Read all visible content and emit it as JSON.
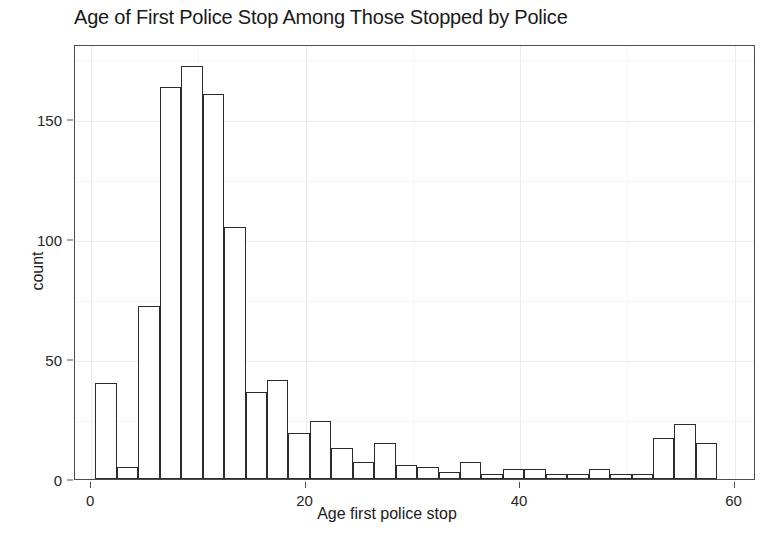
{
  "chart_data": {
    "type": "bar",
    "title": "Age of First Police Stop Among Those Stopped by Police",
    "xlabel": "Age first police stop",
    "ylabel": "count",
    "subtitle": "",
    "grid": true,
    "legend": "none",
    "binwidth": 2,
    "bin_start": 0.4,
    "xlim": [
      -1.5,
      62
    ],
    "ylim": [
      0,
      181
    ],
    "x_ticks": [
      0,
      20,
      40,
      60
    ],
    "x_tick_labels": [
      "0",
      "20",
      "40",
      "60"
    ],
    "x_minor_ticks": [
      10,
      30,
      50
    ],
    "y_ticks": [
      0,
      50,
      100,
      150
    ],
    "y_tick_labels": [
      "0",
      "50",
      "100",
      "150"
    ],
    "y_minor_ticks": [
      25,
      75,
      125,
      175
    ],
    "categories": [
      "0.4-2.4",
      "2.4-4.4",
      "4.4-6.4",
      "6.4-8.4",
      "8.4-10.4",
      "10.4-12.4",
      "12.4-14.4",
      "14.4-16.4",
      "16.4-18.4",
      "18.4-20.4",
      "20.4-22.4",
      "22.4-24.4",
      "24.4-26.4",
      "26.4-28.4",
      "28.4-30.4",
      "30.4-32.4",
      "32.4-34.4",
      "34.4-36.4",
      "36.4-38.4",
      "38.4-40.4",
      "40.4-42.4",
      "42.4-44.4",
      "44.4-46.4",
      "46.4-48.4",
      "48.4-50.4",
      "50.4-52.4",
      "52.4-54.4",
      "54.4-56.4",
      "56.4-58.4"
    ],
    "bin_centers": [
      1.4,
      3.4,
      5.4,
      7.4,
      9.4,
      11.4,
      13.4,
      15.4,
      17.4,
      19.4,
      21.4,
      23.4,
      25.4,
      27.4,
      29.4,
      31.4,
      33.4,
      35.4,
      37.4,
      39.4,
      41.4,
      43.4,
      45.4,
      47.4,
      49.4,
      51.4,
      53.4,
      55.4,
      57.4
    ],
    "values": [
      40,
      5,
      72,
      163,
      172,
      160,
      105,
      36,
      41,
      19,
      24,
      13,
      7,
      15,
      6,
      5,
      3,
      7,
      2,
      4,
      4,
      2,
      2,
      4,
      2,
      2,
      17,
      23,
      15
    ],
    "colors": {
      "bar_fill": "#ffffff",
      "bar_stroke": "#2b2b2b",
      "panel_bg": "#ffffff",
      "grid_major": "#ebebeb",
      "grid_minor": "#f4f4f4",
      "axis_text": "#262626",
      "title_text": "#1a1a1a"
    }
  }
}
